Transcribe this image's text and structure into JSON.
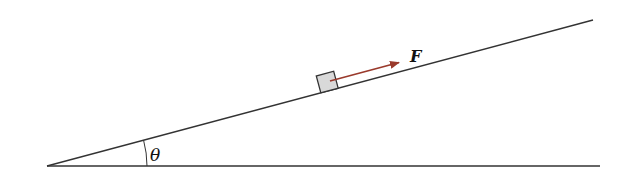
{
  "diagram": {
    "labels": {
      "force": "F",
      "angle": "θ"
    },
    "colors": {
      "line": "#333333",
      "force_arrow": "#9a3a2c",
      "block_fill": "#d9d9d9",
      "block_stroke": "#333333"
    },
    "elements": [
      {
        "id": "incline",
        "type": "line",
        "from": [
          47,
          166
        ],
        "to": [
          593,
          20
        ]
      },
      {
        "id": "ground",
        "type": "line",
        "from": [
          47,
          166
        ],
        "to": [
          600,
          166
        ]
      },
      {
        "id": "block",
        "type": "square",
        "on": "incline"
      },
      {
        "id": "force-arrow",
        "type": "arrow",
        "direction": "up-slope",
        "label": "F"
      },
      {
        "id": "angle-arc",
        "type": "arc",
        "label": "θ"
      }
    ]
  }
}
